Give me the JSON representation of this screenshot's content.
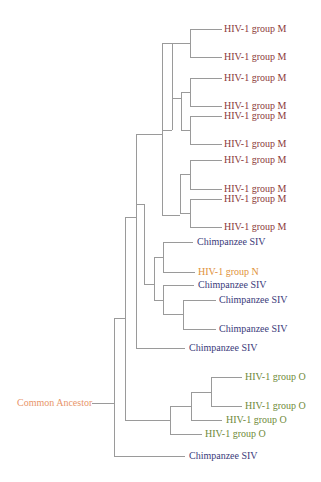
{
  "diagram": {
    "type": "phylogenetic-tree",
    "root_label": "Common Ancestor",
    "colors": {
      "group_M": "#8b3a3a",
      "group_N": "#e0913a",
      "group_O": "#6f8a3a",
      "chimp_siv": "#3a3a7a",
      "root": "#e8956a",
      "branch": "#9a9a9a"
    },
    "leaves": [
      {
        "label": "HIV-1 group M",
        "group": "M"
      },
      {
        "label": "HIV-1 group M",
        "group": "M"
      },
      {
        "label": "HIV-1 group M",
        "group": "M"
      },
      {
        "label": "HIV-1 group M",
        "group": "M"
      },
      {
        "label": "HIV-1 group M",
        "group": "M"
      },
      {
        "label": "HIV-1 group M",
        "group": "M"
      },
      {
        "label": "HIV-1 group M",
        "group": "M"
      },
      {
        "label": "HIV-1 group M",
        "group": "M"
      },
      {
        "label": "HIV-1 group M",
        "group": "M"
      },
      {
        "label": "HIV-1 group M",
        "group": "M"
      },
      {
        "label": "Chimpanzee SIV",
        "group": "SIV"
      },
      {
        "label": "HIV-1 group N",
        "group": "N"
      },
      {
        "label": "Chimpanzee SIV",
        "group": "SIV"
      },
      {
        "label": "Chimpanzee SIV",
        "group": "SIV"
      },
      {
        "label": "Chimpanzee SIV",
        "group": "SIV"
      },
      {
        "label": "Chimpanzee SIV",
        "group": "SIV"
      },
      {
        "label": "HIV-1 group O",
        "group": "O"
      },
      {
        "label": "HIV-1 group O",
        "group": "O"
      },
      {
        "label": "HIV-1 group O",
        "group": "O"
      },
      {
        "label": "HIV-1 group O",
        "group": "O"
      },
      {
        "label": "Chimpanzee SIV",
        "group": "SIV"
      }
    ]
  }
}
